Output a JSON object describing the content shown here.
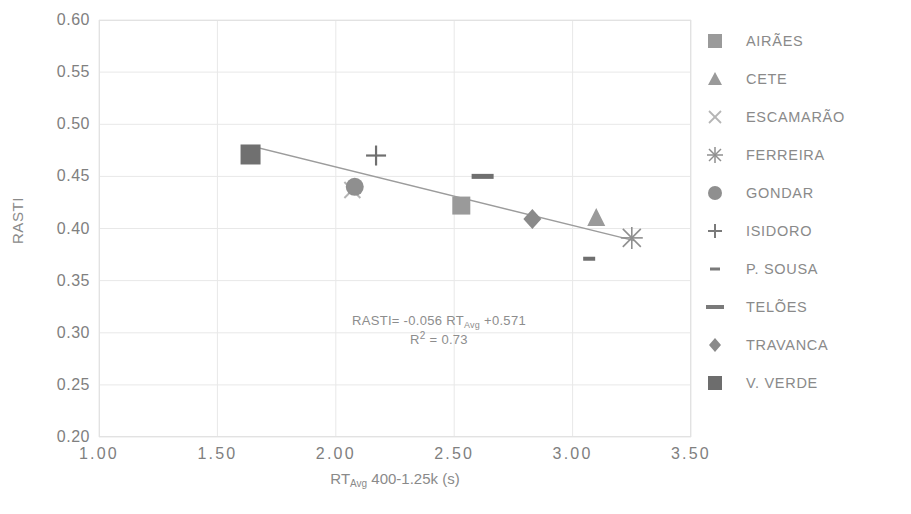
{
  "chart_data": {
    "type": "scatter",
    "title": "",
    "xlabel": "RT_Avg 400-1.25k (s)",
    "xlabel_parts": {
      "prefix": "RT",
      "sub": "Avg",
      "suffix": " 400-1.25k (s)"
    },
    "ylabel": "RASTI",
    "xlim": [
      1.0,
      3.5
    ],
    "ylim": [
      0.2,
      0.6
    ],
    "x_ticks": [
      "1.00",
      "1.50",
      "2.00",
      "2.50",
      "3.00",
      "3.50"
    ],
    "x_tick_values": [
      1.0,
      1.5,
      2.0,
      2.5,
      3.0,
      3.5
    ],
    "y_ticks": [
      "0.60",
      "0.55",
      "0.50",
      "0.45",
      "0.40",
      "0.35",
      "0.30",
      "0.25",
      "0.20"
    ],
    "y_tick_values": [
      0.6,
      0.55,
      0.5,
      0.45,
      0.4,
      0.35,
      0.3,
      0.25,
      0.2
    ],
    "grid": true,
    "grid_color": "#e8e8e8",
    "legend_position": "right",
    "series": [
      {
        "name": "AIRÃES",
        "marker": "square",
        "x": 2.53,
        "y": 0.422,
        "color": "#9a9a9a"
      },
      {
        "name": "CETE",
        "marker": "triangle",
        "x": 3.1,
        "y": 0.41,
        "color": "#9a9a9a"
      },
      {
        "name": "ESCAMARÃO",
        "marker": "cross-x",
        "x": 2.07,
        "y": 0.437,
        "color": "#b5b5b5"
      },
      {
        "name": "FERREIRA",
        "marker": "asterisk",
        "x": 3.25,
        "y": 0.391,
        "color": "#8f8f8f"
      },
      {
        "name": "GONDAR",
        "marker": "circle",
        "x": 2.08,
        "y": 0.44,
        "color": "#8f8f8f"
      },
      {
        "name": "ISIDORO",
        "marker": "plus",
        "x": 2.17,
        "y": 0.47,
        "color": "#6f6f6f"
      },
      {
        "name": "P. SOUSA",
        "marker": "dash-short",
        "x": 3.07,
        "y": 0.371,
        "color": "#6f6f6f"
      },
      {
        "name": "TELÕES",
        "marker": "dash-long",
        "x": 2.62,
        "y": 0.45,
        "color": "#6f6f6f"
      },
      {
        "name": "TRAVANCA",
        "marker": "diamond",
        "x": 2.83,
        "y": 0.409,
        "color": "#8a8a8a"
      },
      {
        "name": "V. VERDE",
        "marker": "square-filled",
        "x": 1.64,
        "y": 0.471,
        "color": "#707070"
      }
    ],
    "trendline": {
      "slope": -0.056,
      "intercept": 0.571,
      "r_squared": 0.73,
      "x_start": 1.64,
      "x_end": 3.26,
      "color": "#9c9c9c"
    },
    "annotation": {
      "equation_prefix": "RASTI= -0.056 RT",
      "equation_sub": "Avg",
      "equation_suffix": " +0.571",
      "r2_prefix": "R",
      "r2_sup": "2",
      "r2_suffix": " = 0.73",
      "equation_full": "RASTI= -0.056 RT_Avg +0.571",
      "r2_full": "R² = 0.73"
    }
  },
  "legend": {
    "items": [
      {
        "label": "AIRÃES"
      },
      {
        "label": "CETE"
      },
      {
        "label": "ESCAMARÃO"
      },
      {
        "label": "FERREIRA"
      },
      {
        "label": "GONDAR"
      },
      {
        "label": "ISIDORO"
      },
      {
        "label": "P. SOUSA"
      },
      {
        "label": "TELÕES"
      },
      {
        "label": "TRAVANCA"
      },
      {
        "label": "V. VERDE"
      }
    ]
  }
}
